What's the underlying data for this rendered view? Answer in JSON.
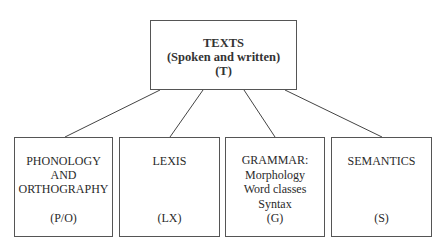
{
  "diagram": {
    "root": {
      "lines": [
        "TEXTS",
        "(Spoken and written)",
        "(T)"
      ]
    },
    "children": [
      {
        "lines": [
          "PHONOLOGY",
          "AND",
          "ORTHOGRAPHY"
        ],
        "abbr": "(P/O)"
      },
      {
        "lines": [
          "LEXIS"
        ],
        "abbr": "(LX)"
      },
      {
        "lines": [
          "GRAMMAR:",
          "Morphology",
          "Word classes",
          "Syntax"
        ],
        "abbr": "(G)"
      },
      {
        "lines": [
          "SEMANTICS"
        ],
        "abbr": "(S)"
      }
    ],
    "connectors": [
      {
        "from": [
          160,
          90
        ],
        "to": [
          65,
          137
        ]
      },
      {
        "from": [
          203,
          90
        ],
        "to": [
          170,
          137
        ]
      },
      {
        "from": [
          244,
          90
        ],
        "to": [
          275,
          137
        ]
      },
      {
        "from": [
          285,
          90
        ],
        "to": [
          382,
          137
        ]
      }
    ]
  }
}
